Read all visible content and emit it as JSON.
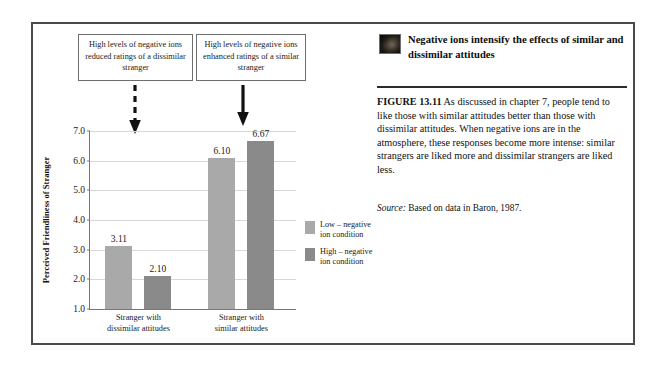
{
  "figure": {
    "heading": "Negative ions intensify the effects of similar and dissimilar attitudes",
    "figure_label": "FIGURE 13.11",
    "caption": "As discussed in chapter 7, people tend to like those with similar attitudes better than those with dissimilar attitudes. When negative ions are in the atmosphere, these responses become more intense: similar strangers are liked more and dissimilar strangers are liked less.",
    "source_label": "Source:",
    "source_text": "Based on data in Baron, 1987.",
    "thumbnail": "photo-thumbnail-icon"
  },
  "callouts": [
    {
      "id": "callout-left",
      "text": "High levels of negative ions reduced ratings of a dissimilar stranger",
      "arrow": "dashed-down-arrow"
    },
    {
      "id": "callout-right",
      "text": "High levels of negative ions enhanced ratings of a similar stranger",
      "arrow": "solid-down-arrow"
    }
  ],
  "colors": {
    "bar_low": "#a9a9a9",
    "bar_high": "#8a8a8a",
    "gridline": "#d8d8d8",
    "axis": "#777777",
    "frame": "#4a4a4a"
  },
  "chart_data": {
    "type": "bar",
    "title": "",
    "xlabel": "",
    "ylabel": "Perceived Friendliness of Stranger",
    "categories": [
      "Stranger with dissimilar attitudes",
      "Stranger with similar attitudes"
    ],
    "category_lines": [
      [
        "Stranger with",
        "dissimilar attitudes"
      ],
      [
        "Stranger with",
        "similar attitudes"
      ]
    ],
    "series": [
      {
        "name": "Low – negative ion condition",
        "values": [
          3.11,
          6.1
        ],
        "color": "#a9a9a9"
      },
      {
        "name": "High – negative ion condition",
        "values": [
          2.1,
          6.67
        ],
        "color": "#8a8a8a"
      }
    ],
    "value_labels": [
      "3.11",
      "2.10",
      "6.10",
      "6.67"
    ],
    "ylim": [
      1.0,
      7.0
    ],
    "yticks": [
      1.0,
      2.0,
      3.0,
      4.0,
      5.0,
      6.0,
      7.0
    ],
    "ytick_labels": [
      "1.0",
      "2.0",
      "3.0",
      "4.0",
      "5.0",
      "6.0",
      "7.0"
    ],
    "grid": true,
    "legend_position": "right"
  },
  "legend": {
    "items": [
      {
        "label_line1": "Low – negative",
        "label_line2": "ion condition",
        "color": "#a9a9a9"
      },
      {
        "label_line1": "High – negative",
        "label_line2": "ion condition",
        "color": "#8a8a8a"
      }
    ]
  }
}
